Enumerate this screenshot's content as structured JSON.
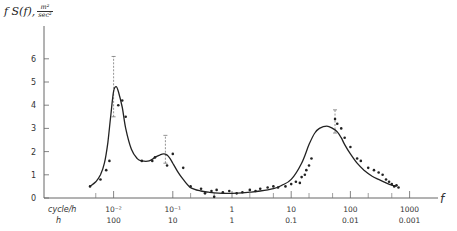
{
  "chart_data": {
    "type": "line",
    "title": "",
    "ylabel": {
      "prefix": "f S(f),",
      "unit_numerator": "m²",
      "unit_denominator": "sec²"
    },
    "xlabel": "f",
    "x_scale": "log",
    "xlim": [
      0.003,
      2000
    ],
    "ylim": [
      0,
      7
    ],
    "y_ticks": [
      0,
      1,
      2,
      3,
      4,
      5,
      6
    ],
    "y_tick_labels": [
      "0",
      "1",
      "2",
      "3",
      "4",
      "5",
      "6"
    ],
    "x_unit_row1_label": "cycle/h",
    "x_unit_row2_label": "h",
    "x_major_ticks": [
      0.01,
      0.1,
      1,
      10,
      100,
      1000
    ],
    "x_tick_labels_row1": [
      "10⁻²",
      "10⁻¹",
      "1",
      "10",
      "100",
      "1000"
    ],
    "x_tick_labels_row2": [
      "100",
      "10",
      "1",
      "0.1",
      "0.01",
      "0.001"
    ],
    "x_minor_ticks": [
      0.005,
      0.2,
      0.5,
      2,
      5,
      20,
      50,
      200,
      500
    ],
    "grid": false,
    "legend": null,
    "series": [
      {
        "name": "fitted spectrum",
        "style": "solid-curve",
        "x": [
          0.004,
          0.005,
          0.006,
          0.007,
          0.008,
          0.009,
          0.01,
          0.011,
          0.012,
          0.014,
          0.016,
          0.02,
          0.025,
          0.03,
          0.04,
          0.05,
          0.06,
          0.07,
          0.08,
          0.09,
          0.1,
          0.12,
          0.15,
          0.2,
          0.3,
          0.4,
          0.5,
          0.7,
          1,
          1.5,
          2,
          3,
          5,
          7,
          10,
          15,
          20,
          25,
          30,
          40,
          50,
          60,
          70,
          80,
          100,
          130,
          170,
          230,
          300,
          400,
          500,
          600
        ],
        "y": [
          0.5,
          0.7,
          1.0,
          1.5,
          2.4,
          3.6,
          4.6,
          4.8,
          4.6,
          3.9,
          3.0,
          2.1,
          1.7,
          1.6,
          1.6,
          1.75,
          1.85,
          1.9,
          1.85,
          1.7,
          1.5,
          1.15,
          0.8,
          0.45,
          0.3,
          0.25,
          0.22,
          0.2,
          0.2,
          0.22,
          0.25,
          0.3,
          0.4,
          0.55,
          0.8,
          1.5,
          2.3,
          2.8,
          3.0,
          3.1,
          3.0,
          2.85,
          2.6,
          2.3,
          1.9,
          1.5,
          1.2,
          0.95,
          0.8,
          0.65,
          0.55,
          0.5
        ]
      },
      {
        "name": "observations",
        "style": "points",
        "x": [
          0.004,
          0.006,
          0.0075,
          0.0085,
          0.012,
          0.014,
          0.016,
          0.03,
          0.045,
          0.05,
          0.08,
          0.1,
          0.15,
          0.2,
          0.3,
          0.35,
          0.45,
          0.5,
          0.55,
          0.7,
          0.9,
          1.2,
          1.5,
          2,
          2.5,
          3,
          4,
          5,
          6,
          8,
          10,
          12,
          14,
          15,
          17,
          18,
          20,
          22,
          55,
          60,
          70,
          80,
          100,
          130,
          150,
          200,
          250,
          300,
          350,
          400,
          450,
          500,
          550,
          600,
          650
        ],
        "y": [
          0.5,
          0.8,
          1.2,
          1.6,
          4.0,
          4.2,
          3.5,
          1.6,
          1.6,
          1.75,
          1.4,
          1.9,
          1.3,
          0.5,
          0.4,
          0.2,
          0.3,
          0.05,
          0.35,
          0.25,
          0.3,
          0.2,
          0.25,
          0.35,
          0.3,
          0.4,
          0.45,
          0.5,
          0.45,
          0.5,
          0.6,
          0.7,
          0.65,
          0.9,
          1.0,
          1.2,
          1.4,
          1.7,
          3.4,
          3.2,
          3.0,
          2.6,
          2.2,
          1.7,
          1.6,
          1.3,
          1.2,
          1.1,
          1.0,
          0.8,
          0.7,
          0.6,
          0.5,
          0.55,
          0.45
        ]
      }
    ],
    "error_bars": [
      {
        "x": 0.01,
        "y": 4.8,
        "low": 3.5,
        "high": 6.1
      },
      {
        "x": 0.075,
        "y": 1.9,
        "low": 1.5,
        "high": 2.7
      },
      {
        "x": 55,
        "y": 3.1,
        "low": 2.8,
        "high": 3.8
      }
    ]
  }
}
